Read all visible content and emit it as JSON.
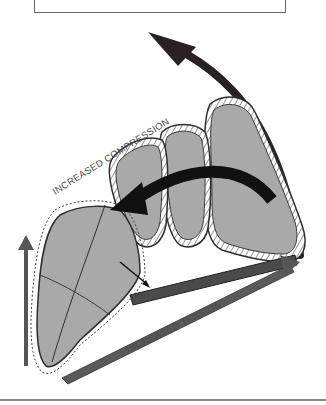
{
  "figure": {
    "labels": {
      "compression": "INCREASED COMPRESSION",
      "tension": "INCREASED TENSION"
    },
    "colors": {
      "bone_fill": "#a9a9a9",
      "outline": "#2e2e2e",
      "arrow_dark": "#2a2222",
      "arrow_gray": "#555555",
      "cartilage": "#ffffff"
    },
    "icons": {
      "top_curved_arrow": "curved-arrow-up-left",
      "rotation_arrow": "curved-arrow-left",
      "left_arrow": "arrow-up",
      "tension_arrow": "arrow-right",
      "small_arrow": "arrow-down-right"
    }
  }
}
